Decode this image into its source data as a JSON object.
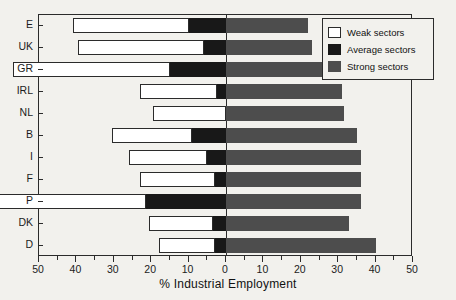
{
  "chart_data": {
    "type": "bar",
    "orientation": "horizontal",
    "stacked": true,
    "diverging": true,
    "title": "",
    "xlabel": "% Industrial Employment",
    "ylabel": "",
    "xlim": [
      -50,
      50
    ],
    "xticks": [
      -50,
      -40,
      -30,
      -20,
      -10,
      0,
      10,
      20,
      30,
      40,
      50
    ],
    "xticklabels": [
      "50",
      "40",
      "30",
      "20",
      "10",
      "0",
      "10",
      "20",
      "30",
      "40",
      "50"
    ],
    "xminorticks": [
      -45,
      -35,
      -25,
      -15,
      -5,
      5,
      15,
      25,
      35,
      45
    ],
    "grid": false,
    "legend_position": "top-right",
    "categories": [
      "E",
      "UK",
      "GR",
      "IRL",
      "NL",
      "B",
      "I",
      "F",
      "P",
      "DK",
      "D"
    ],
    "series": [
      {
        "name": "Weak sectors",
        "color": "#ffffff",
        "side": "left",
        "values": [
          31,
          33.5,
          42,
          20.5,
          19.5,
          21.5,
          21,
          20,
          40,
          17,
          15
        ]
      },
      {
        "name": "Average sectors",
        "color": "#181818",
        "side": "left",
        "values": [
          10,
          6,
          15,
          2.5,
          0,
          9,
          5,
          3,
          21.5,
          3.5,
          3
        ]
      },
      {
        "name": "Strong sectors",
        "color": "#4d4d4d",
        "side": "right",
        "values": [
          22,
          23,
          26,
          31,
          31.5,
          35,
          36,
          36,
          36,
          33,
          40
        ]
      }
    ],
    "bars": [
      {
        "category": "E",
        "weak_start": -41,
        "weak_end": -10,
        "average_start": -10,
        "average_end": 0,
        "strong_start": 0,
        "strong_end": 22
      },
      {
        "category": "UK",
        "weak_start": -39.5,
        "weak_end": -6,
        "average_start": -6,
        "average_end": 0,
        "strong_start": 0,
        "strong_end": 23
      },
      {
        "category": "GR",
        "weak_start": -57,
        "weak_end": -15,
        "average_start": -15,
        "average_end": 0,
        "strong_start": 0,
        "strong_end": 26
      },
      {
        "category": "IRL",
        "weak_start": -23,
        "weak_end": -2.5,
        "average_start": -2.5,
        "average_end": 0,
        "strong_start": 0,
        "strong_end": 31
      },
      {
        "category": "NL",
        "weak_start": -19.5,
        "weak_end": 0,
        "average_start": 0,
        "average_end": 0,
        "strong_start": 0,
        "strong_end": 31.5
      },
      {
        "category": "B",
        "weak_start": -30.5,
        "weak_end": -9,
        "average_start": -9,
        "average_end": 0,
        "strong_start": 0,
        "strong_end": 35
      },
      {
        "category": "I",
        "weak_start": -26,
        "weak_end": -5,
        "average_start": -5,
        "average_end": 0,
        "strong_start": 0,
        "strong_end": 36
      },
      {
        "category": "F",
        "weak_start": -23,
        "weak_end": -3,
        "average_start": -3,
        "average_end": 0,
        "strong_start": 0,
        "strong_end": 36
      },
      {
        "category": "P",
        "weak_start": -61.5,
        "weak_end": -21.5,
        "average_start": -21.5,
        "average_end": 0,
        "strong_start": 0,
        "strong_end": 36
      },
      {
        "category": "DK",
        "weak_start": -20.5,
        "weak_end": -3.5,
        "average_start": -3.5,
        "average_end": 0,
        "strong_start": 0,
        "strong_end": 33
      },
      {
        "category": "D",
        "weak_start": -18,
        "weak_end": -3,
        "average_start": -3,
        "average_end": 0,
        "strong_start": 0,
        "strong_end": 40
      }
    ]
  },
  "legend": {
    "entries": [
      {
        "label": "Weak sectors",
        "swatch": "weak"
      },
      {
        "label": "Average sectors",
        "swatch": "avg"
      },
      {
        "label": "Strong sectors",
        "swatch": "strong"
      }
    ]
  }
}
